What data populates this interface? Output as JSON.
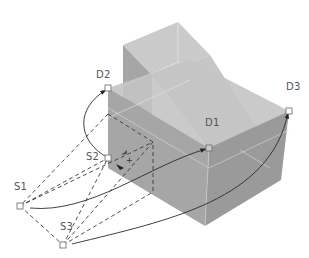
{
  "diagram": {
    "title": "",
    "colors": {
      "background": "#ffffff",
      "solid_top": "#c8c8c8",
      "solid_front": "#a4a4a4",
      "solid_side": "#9a9a9a",
      "solid_dark": "#8e8e8e",
      "edge_highlight": "#e6e6e6",
      "line": "#333333",
      "dashed": "#444444",
      "label": "#555555",
      "marker": "#777777"
    },
    "source_points": [
      {
        "id": "S1",
        "label": "S1",
        "x": 20,
        "y": 206
      },
      {
        "id": "S2",
        "label": "S2",
        "x": 108,
        "y": 158
      },
      {
        "id": "S3",
        "label": "S3",
        "x": 63,
        "y": 245
      }
    ],
    "destination_points": [
      {
        "id": "D1",
        "label": "D1",
        "x": 209,
        "y": 148
      },
      {
        "id": "D2",
        "label": "D2",
        "x": 108,
        "y": 88
      },
      {
        "id": "D3",
        "label": "D3",
        "x": 289,
        "y": 111
      }
    ],
    "mappings": [
      {
        "from": "S1",
        "to": "D1"
      },
      {
        "from": "S2",
        "to": "D2"
      },
      {
        "from": "S3",
        "to": "D3"
      }
    ]
  }
}
